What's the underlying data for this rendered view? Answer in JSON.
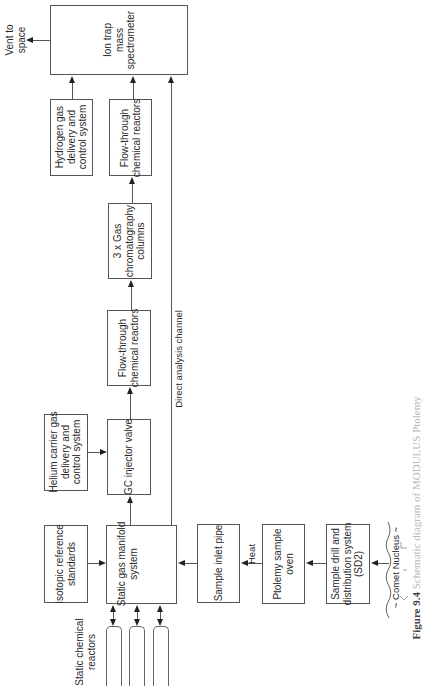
{
  "diagram": {
    "orientation": "rotated-90-ccw",
    "nodes": {
      "ion_trap": "Ion trap\nmass\nspectrometer",
      "hydrogen": "Hydrogen gas\ndelivery and\ncontrol system",
      "flow_through_1": "Flow-through\nchemical reactors",
      "gc_columns": "3 x Gas\nchromatography\ncolumns",
      "flow_through_2": "Flow-through\nchemical reactors",
      "gc_injector": "GC injector valve",
      "helium": "Helium carrier gas\ndelivery and\ncontrol system",
      "isotopic": "Isotopic reference\nstandards",
      "manifold": "Static gas manifold\nsystem",
      "inlet_pipe": "Sample inlet pipe",
      "oven": "Ptolemy sample\noven",
      "drill": "Sample drill and\ndistribution system\n(SD2)"
    },
    "labels": {
      "vent": "Vent to\nspace",
      "direct": "Direct analysis channel",
      "heat": "Heat",
      "static_reactors": "Static chemical\nreactors",
      "comet": "~ Comet Nucleus ~"
    },
    "edges": [
      {
        "from": "ion_trap",
        "to": "vent"
      },
      {
        "from": "hydrogen",
        "to": "ion_trap"
      },
      {
        "from": "flow_through_1",
        "to": "ion_trap"
      },
      {
        "from": "manifold",
        "to": "ion_trap",
        "label": "Direct analysis channel"
      },
      {
        "from": "gc_columns",
        "to": "flow_through_1"
      },
      {
        "from": "flow_through_2",
        "to": "gc_columns"
      },
      {
        "from": "gc_injector",
        "to": "flow_through_2"
      },
      {
        "from": "helium",
        "to": "gc_injector"
      },
      {
        "from": "manifold",
        "to": "gc_injector"
      },
      {
        "from": "isotopic",
        "to": "manifold"
      },
      {
        "from": "inlet_pipe",
        "to": "manifold"
      },
      {
        "from": "oven",
        "to": "inlet_pipe",
        "label": "Heat"
      },
      {
        "from": "drill",
        "to": "oven"
      },
      {
        "from": "comet",
        "to": "drill"
      },
      {
        "from": "manifold",
        "to": "static_reactors",
        "bidirectional": true,
        "count": 3
      }
    ],
    "caption_bold": "Figure 9.4",
    "caption_text": " Schematic diagram of MODULUS Ptolemy"
  }
}
